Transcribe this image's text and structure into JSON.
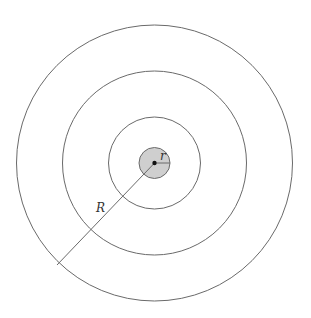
{
  "diagram": {
    "type": "concentric-circles",
    "center": [
      154.5,
      163
    ],
    "core": {
      "radius": 15.5,
      "fill": "#cfcfcf"
    },
    "rings": [
      {
        "radius": 46
      },
      {
        "radius": 92
      },
      {
        "radius": 138
      }
    ],
    "labels": {
      "small_radius": "r",
      "large_radius": "R"
    },
    "colors": {
      "stroke": "#6a6a6a",
      "background": "#ffffff"
    }
  }
}
